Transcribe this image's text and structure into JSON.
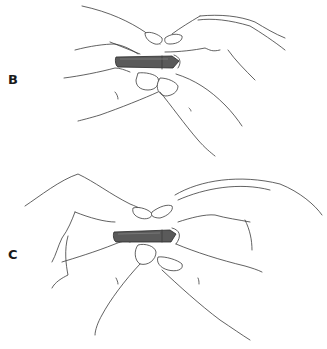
{
  "figure": {
    "panels": [
      {
        "id": "B",
        "label": "B",
        "object": "stick held between thumbs and index fingers of both hands"
      },
      {
        "id": "C",
        "label": "C",
        "object": "stick held between thumbs and index fingers of both hands, wider grip"
      }
    ],
    "colors": {
      "line": "#3a3a3a",
      "stick_fill": "#5a5a5a",
      "background": "#ffffff"
    }
  }
}
